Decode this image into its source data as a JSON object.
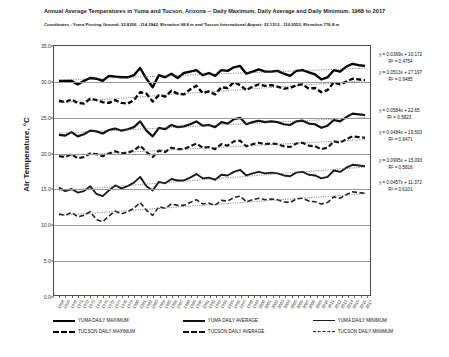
{
  "title": "Annual Average Temperatures in Yuma and Tucson, Arizona -- Daily Maximum, Daily Average and Daily Minimum, 1968 to 2017",
  "subtitle": "Coordinates :  Yuma Proving Ground: 32.8356, -114.3942, Elevation 98.8 m and Tucson International Airport: 32.1313, -110.9552, Elevation 776.8 m",
  "ylabel": "Air Temperature, °C",
  "equations": [
    {
      "name": "yuma-maximum-trend",
      "equation": "y = 0.0369x + 10.172",
      "r2": "R² = 0.4754",
      "top": 52
    },
    {
      "name": "tucson-maximum-trend",
      "equation": "y = 0.0513x + 27.197",
      "r2": "R² = 0.9485",
      "top": 70
    },
    {
      "name": "yuma-average-trend",
      "equation": "y = 0.0584x + 22.65",
      "r2": "R² = 0.5823",
      "top": 108
    },
    {
      "name": "tucson-average-trend",
      "equation": "y = 0.0484x + 19.503",
      "r2": "R² = 0.6471",
      "top": 130
    },
    {
      "name": "yuma-minimum-trend",
      "equation": "y = 0.0995x + 15.093",
      "r2": "R² = 0.5816",
      "top": 158
    },
    {
      "name": "tucson-minimum-trend",
      "equation": "y = 0.0457x + 11.372",
      "r2": "R² = 0.6101",
      "top": 180
    }
  ],
  "legend": {
    "row1": [
      {
        "label": "YUMA DAILY MAXIMUM",
        "style": "sw-solid-thick"
      },
      {
        "label": "YUMA DAILY AVERAGE",
        "style": "sw-solid-med"
      },
      {
        "label": "YUMA DAILY MINIMUM",
        "style": "sw-solid-thin"
      }
    ],
    "row2": [
      {
        "label": "TUCSON DAILY MAXIMUM",
        "style": "sw-dash-thick"
      },
      {
        "label": "TUCSON DAILY AVERAGE",
        "style": "sw-dash-med"
      },
      {
        "label": "TUCSON DAILY MINIMUM",
        "style": "sw-dash-thin"
      }
    ]
  },
  "chart_data": {
    "type": "line",
    "title": "Annual Average Temperatures in Yuma and Tucson, Arizona -- Daily Maximum, Daily Average and Daily Minimum, 1968 to 2017",
    "subtitle": "Coordinates :  Yuma Proving Ground: 32.8356, -114.3942, Elevation 98.8 m and Tucson International Airport: 32.1313, -110.9552, Elevation 776.8 m",
    "xlabel": "",
    "ylabel": "Air Temperature, °C",
    "ylim": [
      0.0,
      35.0
    ],
    "yticks": [
      0.0,
      5.0,
      10.0,
      15.0,
      20.0,
      25.0,
      30.0,
      35.0
    ],
    "ytick_labels": [
      "0.0",
      "5.0",
      "10.0",
      "15.0",
      "20.0",
      "25.0",
      "30.0",
      "35.0"
    ],
    "grid": true,
    "legend_position": "bottom",
    "x": [
      1968,
      1969,
      1970,
      1971,
      1972,
      1973,
      1974,
      1975,
      1976,
      1977,
      1978,
      1979,
      1980,
      1981,
      1982,
      1983,
      1984,
      1985,
      1986,
      1987,
      1988,
      1989,
      1990,
      1991,
      1992,
      1993,
      1994,
      1995,
      1996,
      1997,
      1998,
      1999,
      2000,
      2001,
      2002,
      2003,
      2004,
      2005,
      2006,
      2007,
      2008,
      2009,
      2010,
      2011,
      2012,
      2013,
      2014,
      2015,
      2016,
      2017
    ],
    "xtick_labels": [
      "1968",
      "1969",
      "1970",
      "1971",
      "1972",
      "1973",
      "1974",
      "1975",
      "1976",
      "1977",
      "1978",
      "1979",
      "1980",
      "1981",
      "1982",
      "1983",
      "1984",
      "1985",
      "1986",
      "1987",
      "1988",
      "1989",
      "1990",
      "1991",
      "1992",
      "1993",
      "1994",
      "1995",
      "1996",
      "1997",
      "1998",
      "1999",
      "2000",
      "2001",
      "2002",
      "2003",
      "2004",
      "2005",
      "2006",
      "2007",
      "2008",
      "2009",
      "2010",
      "2011",
      "2012",
      "2013",
      "2014",
      "2015",
      "2016",
      "2017"
    ],
    "series": [
      {
        "name": "YUMA DAILY MAXIMUM",
        "style": "solid",
        "width": 2.4,
        "color": "#000000",
        "trend_equation": "y = 0.0369x + 10.172",
        "trend_r2": 0.4754,
        "values": [
          30.1,
          30.1,
          30.1,
          29.6,
          30.1,
          30.5,
          30.4,
          30.1,
          30.8,
          30.7,
          30.6,
          30.6,
          30.9,
          31.9,
          30.4,
          29.2,
          30.9,
          30.6,
          31.1,
          30.5,
          31.2,
          31.4,
          31.6,
          30.9,
          31.2,
          30.8,
          31.6,
          31.5,
          32.0,
          32.2,
          31.1,
          31.4,
          31.7,
          31.4,
          31.4,
          31.5,
          31.1,
          30.8,
          31.5,
          31.6,
          31.3,
          31.0,
          30.3,
          30.6,
          31.6,
          31.4,
          32.1,
          32.5,
          32.3,
          32.2
        ]
      },
      {
        "name": "TUCSON DAILY MAXIMUM",
        "style": "dashed",
        "width": 2.4,
        "color": "#000000",
        "trend_equation": "y = 0.0513x + 27.197",
        "trend_r2": 0.9485,
        "values": [
          27.3,
          27.1,
          27.5,
          27.0,
          26.9,
          27.6,
          27.4,
          27.1,
          27.0,
          27.4,
          27.0,
          26.9,
          27.4,
          28.5,
          28.3,
          27.2,
          28.1,
          27.9,
          28.7,
          28.3,
          28.2,
          28.9,
          29.4,
          28.4,
          28.6,
          28.2,
          29.2,
          29.1,
          29.9,
          29.5,
          28.8,
          29.3,
          29.6,
          29.4,
          29.5,
          29.3,
          29.0,
          29.1,
          29.5,
          29.6,
          29.0,
          29.1,
          28.5,
          28.8,
          29.9,
          29.6,
          30.0,
          30.4,
          30.3,
          30.2
        ]
      },
      {
        "name": "YUMA DAILY AVERAGE",
        "style": "solid",
        "width": 2.2,
        "color": "#111111",
        "trend_equation": "y = 0.0584x + 22.65",
        "trend_r2": 0.5823,
        "values": [
          22.5,
          22.4,
          22.9,
          22.3,
          22.6,
          23.1,
          23.0,
          22.7,
          23.2,
          23.4,
          23.1,
          23.3,
          23.6,
          24.4,
          23.1,
          22.3,
          23.5,
          23.3,
          23.9,
          23.6,
          23.7,
          24.0,
          24.4,
          23.8,
          23.9,
          23.6,
          24.3,
          24.1,
          24.7,
          24.9,
          24.0,
          24.3,
          24.5,
          24.3,
          24.4,
          24.3,
          24.0,
          23.9,
          24.4,
          24.5,
          24.1,
          24.0,
          23.5,
          23.8,
          24.6,
          24.4,
          25.0,
          25.5,
          25.4,
          25.3
        ]
      },
      {
        "name": "TUCSON DAILY AVERAGE",
        "style": "dashed",
        "width": 2.2,
        "color": "#111111",
        "trend_equation": "y = 0.0484x + 19.503",
        "trend_r2": 0.6471,
        "values": [
          19.5,
          19.4,
          19.8,
          19.2,
          19.4,
          19.9,
          19.8,
          19.5,
          19.9,
          20.2,
          19.9,
          20.0,
          20.3,
          21.0,
          20.1,
          19.4,
          20.3,
          20.1,
          20.7,
          20.5,
          20.5,
          20.9,
          21.3,
          20.7,
          20.8,
          20.5,
          21.2,
          21.0,
          21.6,
          21.7,
          20.9,
          21.2,
          21.4,
          21.2,
          21.3,
          21.2,
          20.9,
          20.8,
          21.3,
          21.4,
          21.0,
          20.9,
          20.5,
          20.7,
          21.6,
          21.4,
          21.9,
          22.3,
          22.2,
          22.1
        ]
      },
      {
        "name": "YUMA DAILY MINIMUM",
        "style": "solid",
        "width": 1.9,
        "color": "#1b1b1b",
        "trend_equation": "y = 0.0995x + 15.093",
        "trend_r2": 0.5816,
        "values": [
          15.1,
          14.6,
          14.9,
          14.4,
          14.6,
          15.3,
          14.2,
          13.9,
          14.7,
          15.4,
          15.0,
          15.3,
          15.8,
          16.6,
          15.3,
          14.7,
          15.9,
          15.7,
          16.3,
          16.1,
          16.1,
          16.5,
          17.0,
          16.4,
          16.5,
          16.2,
          16.9,
          16.8,
          17.3,
          17.6,
          16.8,
          17.1,
          17.3,
          17.1,
          17.2,
          17.1,
          16.8,
          16.7,
          17.2,
          17.3,
          16.9,
          16.8,
          16.4,
          16.6,
          17.5,
          17.3,
          17.9,
          18.3,
          18.2,
          18.1
        ]
      },
      {
        "name": "TUCSON DAILY MINIMUM",
        "style": "dashed",
        "width": 1.6,
        "color": "#222222",
        "trend_equation": "y = 0.0457x + 11.372",
        "trend_r2": 0.6101,
        "values": [
          11.4,
          11.2,
          11.6,
          11.0,
          11.2,
          11.7,
          10.6,
          10.3,
          11.1,
          11.8,
          11.4,
          11.7,
          12.2,
          13.0,
          11.9,
          11.2,
          12.4,
          12.2,
          12.8,
          12.6,
          12.6,
          13.0,
          13.4,
          12.8,
          12.9,
          12.6,
          13.3,
          13.2,
          13.7,
          13.9,
          13.1,
          13.4,
          13.6,
          13.4,
          13.5,
          13.4,
          13.1,
          13.0,
          13.5,
          13.6,
          13.2,
          13.1,
          12.8,
          13.0,
          13.8,
          13.6,
          14.1,
          14.5,
          14.4,
          14.3
        ]
      }
    ]
  }
}
